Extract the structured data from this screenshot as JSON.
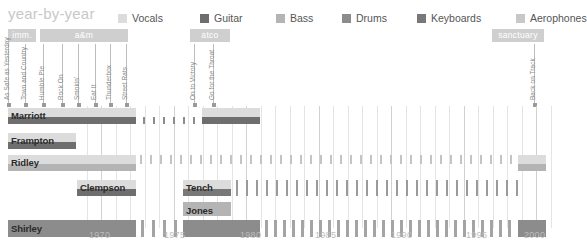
{
  "header": {
    "title": "year-by-year"
  },
  "legend": {
    "items": [
      {
        "label": "Vocals",
        "color": "#dcdcdc",
        "x": 0
      },
      {
        "label": "Guitar",
        "color": "#6e6e6e",
        "x": 82
      },
      {
        "label": "Bass",
        "color": "#b4b4b4",
        "x": 158
      },
      {
        "label": "Drums",
        "color": "#8c8c8c",
        "x": 224
      },
      {
        "label": "Keyboards",
        "color": "#787878",
        "x": 299
      },
      {
        "label": "Aerophones",
        "color": "#c8c8c8",
        "x": 398
      }
    ]
  },
  "eras": {
    "items": [
      {
        "label": "imm.",
        "x": 8,
        "width": 28
      },
      {
        "label": "a&m",
        "x": 40,
        "width": 88
      },
      {
        "label": "atco",
        "x": 190,
        "width": 40
      },
      {
        "label": "sanctuary",
        "x": 492,
        "width": 52
      }
    ],
    "color": "#cfcfcf"
  },
  "albums": {
    "items": [
      {
        "title": "As Safe as Yesterday",
        "x": 8
      },
      {
        "title": "Town and Country",
        "x": 25
      },
      {
        "title": "Humble Pie",
        "x": 43
      },
      {
        "title": "Rock On",
        "x": 62
      },
      {
        "title": "Smokin'",
        "x": 78
      },
      {
        "title": "Eat It",
        "x": 95
      },
      {
        "title": "Thunderbox",
        "x": 110
      },
      {
        "title": "Street Rats",
        "x": 126
      },
      {
        "title": "On to Victory",
        "x": 194
      },
      {
        "title": "Go for the Throat",
        "x": 213
      },
      {
        "title": "Back on Track",
        "x": 534
      }
    ]
  },
  "chart_data": {
    "type": "timeline",
    "title": "year-by-year",
    "xlabel": "",
    "ylabel": "",
    "xlim": [
      1968.2,
      2002.0
    ],
    "grid": true,
    "legend_position": "top-right",
    "xticks": [
      1970,
      1975,
      1980,
      1985,
      1990,
      1995,
      2000
    ],
    "xtick_px": [
      101,
      176,
      252,
      327,
      403,
      478,
      536
    ],
    "minor_grid_years": [
      1969,
      1971,
      1972,
      1973,
      1974,
      1976,
      1977,
      1978,
      1979,
      1981,
      1982,
      1983,
      1984,
      1986,
      1987,
      1988,
      1989,
      1991,
      1992,
      1993,
      1994,
      1996,
      1997,
      1998,
      1999,
      2001
    ],
    "members": [
      {
        "name": "Marriott",
        "row_top": 2,
        "row_height": 22,
        "tracks": [
          {
            "instrument": "Vocals",
            "color": "#dcdcdc",
            "top": 0,
            "height": 9,
            "segments": [
              {
                "x": 8,
                "w": 128
              },
              {
                "x": 202,
                "w": 58
              }
            ]
          },
          {
            "instrument": "Guitar",
            "color": "#6e6e6e",
            "top": 9,
            "height": 7,
            "segments": [
              {
                "x": 8,
                "w": 128
              },
              {
                "x": 202,
                "w": 58
              }
            ]
          },
          {
            "instrument": "Guitar-sporadic",
            "color": "#8c8c8c",
            "top": 9,
            "height": 7,
            "segments": [
              {
                "x": 143,
                "w": 2
              },
              {
                "x": 153,
                "w": 2
              },
              {
                "x": 163,
                "w": 2
              },
              {
                "x": 173,
                "w": 2
              },
              {
                "x": 183,
                "w": 2
              },
              {
                "x": 193,
                "w": 2
              }
            ]
          }
        ]
      },
      {
        "name": "Frampton",
        "row_top": 27,
        "row_height": 20,
        "tracks": [
          {
            "instrument": "Vocals",
            "color": "#dcdcdc",
            "top": 0,
            "height": 9,
            "segments": [
              {
                "x": 8,
                "w": 68
              }
            ]
          },
          {
            "instrument": "Guitar",
            "color": "#6e6e6e",
            "top": 9,
            "height": 7,
            "segments": [
              {
                "x": 8,
                "w": 68
              }
            ]
          }
        ]
      },
      {
        "name": "Ridley",
        "row_top": 49,
        "row_height": 22,
        "tracks": [
          {
            "instrument": "Vocals",
            "color": "#dcdcdc",
            "top": 0,
            "height": 9,
            "segments": [
              {
                "x": 8,
                "w": 128
              },
              {
                "x": 518,
                "w": 28
              }
            ]
          },
          {
            "instrument": "Bass",
            "color": "#b4b4b4",
            "top": 9,
            "height": 7,
            "segments": [
              {
                "x": 8,
                "w": 128
              },
              {
                "x": 518,
                "w": 28
              }
            ]
          },
          {
            "instrument": "Bass-sporadic",
            "color": "#c4c4c4",
            "top": 0,
            "height": 9,
            "segments": [
              {
                "x": 140,
                "w": 2
              },
              {
                "x": 150,
                "w": 2
              },
              {
                "x": 160,
                "w": 2
              },
              {
                "x": 170,
                "w": 2
              },
              {
                "x": 180,
                "w": 2
              },
              {
                "x": 190,
                "w": 2
              },
              {
                "x": 200,
                "w": 2
              },
              {
                "x": 210,
                "w": 2
              },
              {
                "x": 220,
                "w": 2
              },
              {
                "x": 230,
                "w": 2
              },
              {
                "x": 240,
                "w": 2
              },
              {
                "x": 250,
                "w": 2
              },
              {
                "x": 260,
                "w": 2
              },
              {
                "x": 270,
                "w": 2
              },
              {
                "x": 280,
                "w": 2
              },
              {
                "x": 290,
                "w": 2
              },
              {
                "x": 300,
                "w": 2
              },
              {
                "x": 310,
                "w": 2
              },
              {
                "x": 320,
                "w": 2
              },
              {
                "x": 330,
                "w": 2
              },
              {
                "x": 340,
                "w": 2
              },
              {
                "x": 350,
                "w": 2
              },
              {
                "x": 360,
                "w": 2
              },
              {
                "x": 370,
                "w": 2
              },
              {
                "x": 380,
                "w": 2
              },
              {
                "x": 390,
                "w": 2
              },
              {
                "x": 400,
                "w": 2
              },
              {
                "x": 410,
                "w": 2
              },
              {
                "x": 420,
                "w": 2
              },
              {
                "x": 430,
                "w": 2
              },
              {
                "x": 440,
                "w": 2
              },
              {
                "x": 450,
                "w": 2
              },
              {
                "x": 460,
                "w": 2
              },
              {
                "x": 470,
                "w": 2
              },
              {
                "x": 480,
                "w": 2
              },
              {
                "x": 490,
                "w": 2
              },
              {
                "x": 500,
                "w": 2
              },
              {
                "x": 510,
                "w": 2
              }
            ]
          }
        ]
      },
      {
        "name": "Clempson",
        "row_top": 74,
        "row_height": 20,
        "tracks": [
          {
            "instrument": "Vocals",
            "color": "#dcdcdc",
            "top": 0,
            "height": 9,
            "segments": [
              {
                "x": 77,
                "w": 59
              }
            ]
          },
          {
            "instrument": "Guitar",
            "color": "#6e6e6e",
            "top": 9,
            "height": 7,
            "segments": [
              {
                "x": 77,
                "w": 59
              }
            ]
          }
        ]
      },
      {
        "name": "Tench",
        "row_top": 74,
        "row_height": 20,
        "tracks": [
          {
            "instrument": "Vocals",
            "color": "#dcdcdc",
            "top": 0,
            "height": 9,
            "segments": [
              {
                "x": 183,
                "w": 48
              }
            ]
          },
          {
            "instrument": "Keyboards",
            "color": "#787878",
            "top": 9,
            "height": 7,
            "segments": [
              {
                "x": 183,
                "w": 48
              }
            ]
          },
          {
            "instrument": "Keyboards-sporadic",
            "color": "#9a9a9a",
            "top": 0,
            "height": 16,
            "segments": [
              {
                "x": 236,
                "w": 2
              },
              {
                "x": 246,
                "w": 2
              },
              {
                "x": 256,
                "w": 2
              },
              {
                "x": 266,
                "w": 2
              },
              {
                "x": 276,
                "w": 2
              },
              {
                "x": 286,
                "w": 2
              },
              {
                "x": 296,
                "w": 2
              },
              {
                "x": 306,
                "w": 2
              },
              {
                "x": 316,
                "w": 2
              },
              {
                "x": 326,
                "w": 2
              },
              {
                "x": 336,
                "w": 2
              },
              {
                "x": 346,
                "w": 2
              },
              {
                "x": 356,
                "w": 2
              },
              {
                "x": 366,
                "w": 2
              },
              {
                "x": 376,
                "w": 2
              },
              {
                "x": 386,
                "w": 2
              },
              {
                "x": 396,
                "w": 2
              },
              {
                "x": 406,
                "w": 2
              },
              {
                "x": 416,
                "w": 2
              },
              {
                "x": 426,
                "w": 2
              },
              {
                "x": 436,
                "w": 2
              },
              {
                "x": 446,
                "w": 2
              },
              {
                "x": 456,
                "w": 2
              },
              {
                "x": 466,
                "w": 2
              },
              {
                "x": 476,
                "w": 2
              },
              {
                "x": 486,
                "w": 2
              },
              {
                "x": 496,
                "w": 2
              },
              {
                "x": 506,
                "w": 2
              },
              {
                "x": 516,
                "w": 2
              }
            ]
          }
        ]
      },
      {
        "name": "Jones",
        "row_top": 96,
        "row_height": 16,
        "tracks": [
          {
            "instrument": "Bass",
            "color": "#b4b4b4",
            "top": 0,
            "height": 14,
            "segments": [
              {
                "x": 183,
                "w": 48
              }
            ]
          }
        ]
      },
      {
        "name": "Shirley",
        "row_top": 114,
        "row_height": 20,
        "tracks": [
          {
            "instrument": "Drums",
            "color": "#8c8c8c",
            "top": 0,
            "height": 17,
            "segments": [
              {
                "x": 8,
                "w": 128
              },
              {
                "x": 183,
                "w": 77
              },
              {
                "x": 518,
                "w": 28
              }
            ]
          },
          {
            "instrument": "Drums-sporadic",
            "color": "#a4a4a4",
            "top": 0,
            "height": 17,
            "segments": [
              {
                "x": 141,
                "w": 3
              },
              {
                "x": 152,
                "w": 3
              },
              {
                "x": 163,
                "w": 3
              },
              {
                "x": 174,
                "w": 3
              },
              {
                "x": 265,
                "w": 3
              },
              {
                "x": 274,
                "w": 3
              },
              {
                "x": 283,
                "w": 3
              },
              {
                "x": 292,
                "w": 3
              },
              {
                "x": 301,
                "w": 3
              },
              {
                "x": 310,
                "w": 3
              },
              {
                "x": 319,
                "w": 3
              },
              {
                "x": 328,
                "w": 3
              },
              {
                "x": 337,
                "w": 3
              },
              {
                "x": 346,
                "w": 3
              },
              {
                "x": 355,
                "w": 3
              },
              {
                "x": 364,
                "w": 3
              },
              {
                "x": 373,
                "w": 3
              },
              {
                "x": 382,
                "w": 3
              },
              {
                "x": 391,
                "w": 3
              },
              {
                "x": 400,
                "w": 3
              },
              {
                "x": 409,
                "w": 3
              },
              {
                "x": 418,
                "w": 3
              },
              {
                "x": 427,
                "w": 3
              },
              {
                "x": 436,
                "w": 3
              },
              {
                "x": 445,
                "w": 3
              },
              {
                "x": 454,
                "w": 3
              },
              {
                "x": 463,
                "w": 3
              },
              {
                "x": 472,
                "w": 3
              },
              {
                "x": 481,
                "w": 3
              },
              {
                "x": 490,
                "w": 3
              },
              {
                "x": 499,
                "w": 3
              },
              {
                "x": 508,
                "w": 3
              }
            ]
          }
        ]
      }
    ]
  }
}
